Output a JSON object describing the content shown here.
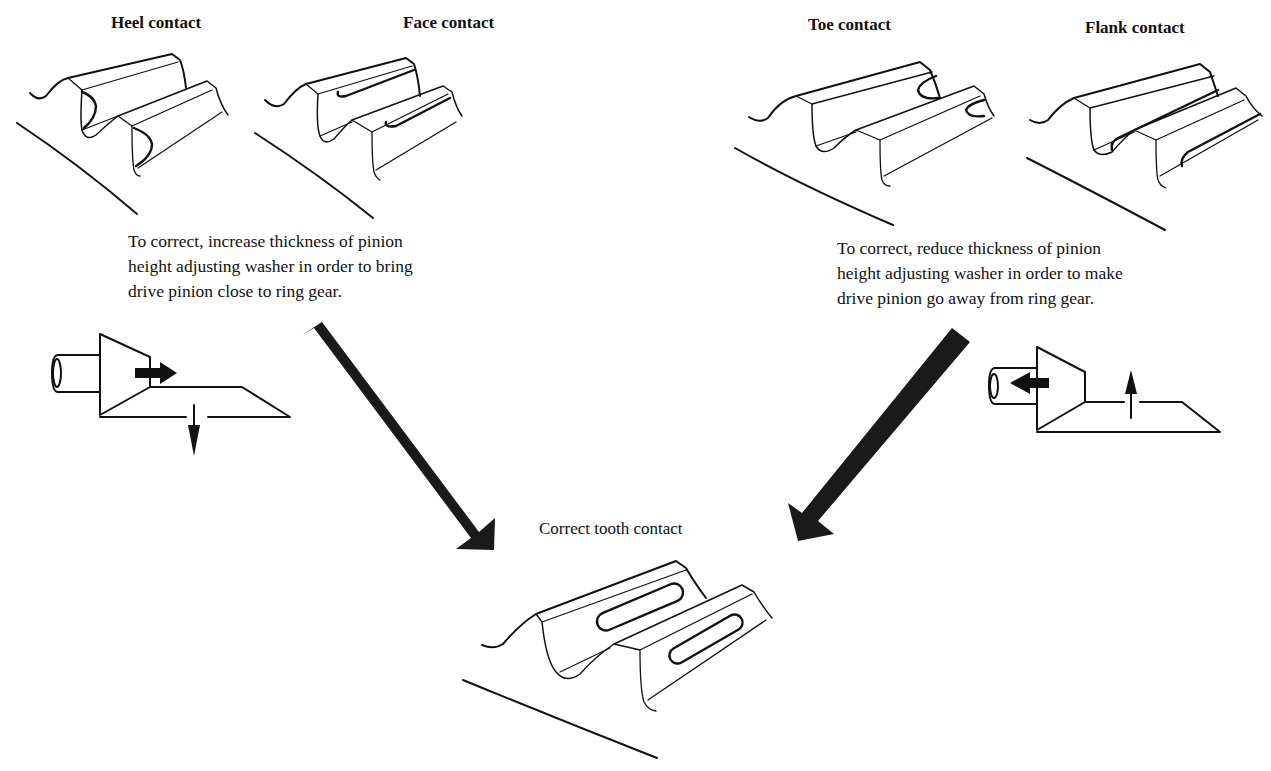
{
  "diagram": {
    "patterns": {
      "heel": {
        "label": "Heel contact"
      },
      "face": {
        "label": "Face contact"
      },
      "toe": {
        "label": "Toe contact"
      },
      "flank": {
        "label": "Flank contact"
      },
      "correct": {
        "label": "Correct tooth contact"
      }
    },
    "corrections": {
      "left": {
        "text": "To correct, increase thickness of pinion\nheight adjusting washer in order to bring\ndrive pinion close to ring gear.",
        "pinion_arrow": "right",
        "ring_gear_arrow": "down"
      },
      "right": {
        "text": "To correct, reduce thickness of pinion\nheight adjusting washer in order to make\ndrive pinion go away from ring gear.",
        "pinion_arrow": "left",
        "ring_gear_arrow": "up"
      }
    },
    "flow_arrows": [
      {
        "from": "left-correction",
        "to": "correct-tooth-contact",
        "color": "#1a1a1a"
      },
      {
        "from": "right-correction",
        "to": "correct-tooth-contact",
        "color": "#1a1a1a"
      }
    ],
    "colors": {
      "ink": "#111111",
      "arrow": "#1a1a1a",
      "background": "#ffffff"
    }
  }
}
